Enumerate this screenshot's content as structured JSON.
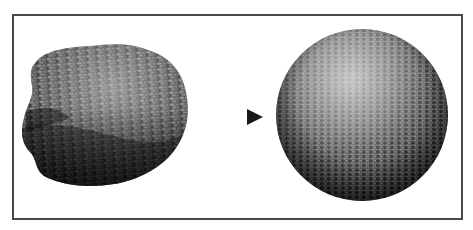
{
  "figure": {
    "caption": "",
    "left_object": {
      "label": "deformed-blob",
      "texture": "brick",
      "shading": "dark"
    },
    "arrow": {
      "direction": "right",
      "style": "dotted-gradient"
    },
    "right_object": {
      "label": "sphere",
      "texture": "brick",
      "shading": "dark"
    }
  },
  "colors": {
    "border": "#4a4a4a",
    "background": "#ffffff",
    "dark": "#1a1a1a",
    "highlight": "#bdbdbd"
  }
}
